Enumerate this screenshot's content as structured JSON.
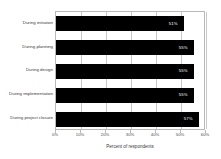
{
  "chart_data": {
    "type": "bar",
    "orientation": "horizontal",
    "title": "",
    "xlabel": "Percent of respondents",
    "ylabel": "",
    "xlim": [
      0,
      60
    ],
    "grid": true,
    "legend": false,
    "xticks": [
      "0%",
      "10%",
      "20%",
      "30%",
      "40%",
      "50%",
      "60%"
    ],
    "xtick_values": [
      0,
      10,
      20,
      30,
      40,
      50,
      60
    ],
    "categories": [
      "During initiation",
      "During planning",
      "During design",
      "During implementation",
      "During project closure"
    ],
    "values": [
      51,
      55,
      55,
      55,
      57
    ],
    "data_labels": [
      "51%",
      "55%",
      "55%",
      "55%",
      "57%"
    ],
    "bar_color": "#000000",
    "data_label_color": "#ffffff"
  }
}
